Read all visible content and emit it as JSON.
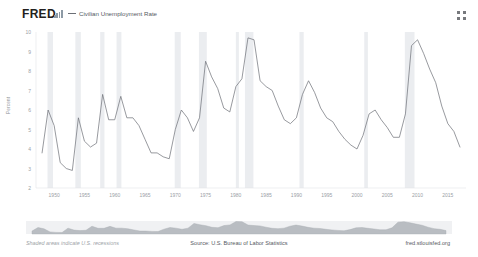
{
  "header": {
    "logo_text": "FRED",
    "logo_mark_icon": "bar-chart-icon",
    "expand_icon": "four-dot-grid-icon",
    "legend": [
      {
        "label": "Civilian Unemployment Rate",
        "color": "#6b6f76"
      }
    ]
  },
  "footer": {
    "recession_note": "Shaded areas indicate U.S. recessions",
    "source": "Source: U.S. Bureau of Labor Statistics",
    "url": "fred.stlouisfed.org"
  },
  "chart_data": {
    "type": "line",
    "title": "Civilian Unemployment Rate",
    "xlabel": "",
    "ylabel": "Percent",
    "xlim": [
      1947,
      2018
    ],
    "ylim": [
      2,
      10
    ],
    "grid": false,
    "legend_position": "top-left",
    "line_color": "#6b6f76",
    "recession_band_color": "#ebedf0",
    "navigator_fill": "#b9bdc2",
    "xticks": [
      1950,
      1955,
      1960,
      1965,
      1970,
      1975,
      1980,
      1985,
      1990,
      1995,
      2000,
      2005,
      2010,
      2015
    ],
    "yticks": [
      2,
      3,
      4,
      5,
      6,
      7,
      8,
      9,
      10
    ],
    "series": [
      {
        "name": "Civilian Unemployment Rate",
        "x": [
          1948,
          1949,
          1950,
          1951,
          1952,
          1953,
          1954,
          1955,
          1956,
          1957,
          1958,
          1959,
          1960,
          1961,
          1962,
          1963,
          1964,
          1965,
          1966,
          1967,
          1968,
          1969,
          1970,
          1971,
          1972,
          1973,
          1974,
          1975,
          1976,
          1977,
          1978,
          1979,
          1980,
          1981,
          1982,
          1983,
          1984,
          1985,
          1986,
          1987,
          1988,
          1989,
          1990,
          1991,
          1992,
          1993,
          1994,
          1995,
          1996,
          1997,
          1998,
          1999,
          2000,
          2001,
          2002,
          2003,
          2004,
          2005,
          2006,
          2007,
          2008,
          2009,
          2010,
          2011,
          2012,
          2013,
          2014,
          2015,
          2016,
          2017
        ],
        "values": [
          3.8,
          6.0,
          5.2,
          3.3,
          3.0,
          2.9,
          5.6,
          4.4,
          4.1,
          4.3,
          6.8,
          5.5,
          5.5,
          6.7,
          5.6,
          5.6,
          5.2,
          4.5,
          3.8,
          3.8,
          3.6,
          3.5,
          5.0,
          6.0,
          5.6,
          4.9,
          5.6,
          8.5,
          7.7,
          7.1,
          6.1,
          5.9,
          7.2,
          7.6,
          9.7,
          9.6,
          7.5,
          7.2,
          7.0,
          6.2,
          5.5,
          5.3,
          5.6,
          6.8,
          7.5,
          6.9,
          6.1,
          5.6,
          5.4,
          4.9,
          4.5,
          4.2,
          4.0,
          4.7,
          5.8,
          6.0,
          5.5,
          5.1,
          4.6,
          4.6,
          5.8,
          9.3,
          9.6,
          8.9,
          8.1,
          7.4,
          6.2,
          5.3,
          4.9,
          4.1
        ]
      }
    ],
    "recessions": [
      {
        "start": 1948.9,
        "end": 1949.8
      },
      {
        "start": 1953.5,
        "end": 1954.4
      },
      {
        "start": 1957.6,
        "end": 1958.3
      },
      {
        "start": 1960.3,
        "end": 1961.1
      },
      {
        "start": 1969.9,
        "end": 1970.9
      },
      {
        "start": 1973.9,
        "end": 1975.2
      },
      {
        "start": 1980.0,
        "end": 1980.5
      },
      {
        "start": 1981.5,
        "end": 1982.9
      },
      {
        "start": 1990.5,
        "end": 1991.2
      },
      {
        "start": 2001.2,
        "end": 2001.8
      },
      {
        "start": 2007.9,
        "end": 2009.5
      }
    ]
  }
}
